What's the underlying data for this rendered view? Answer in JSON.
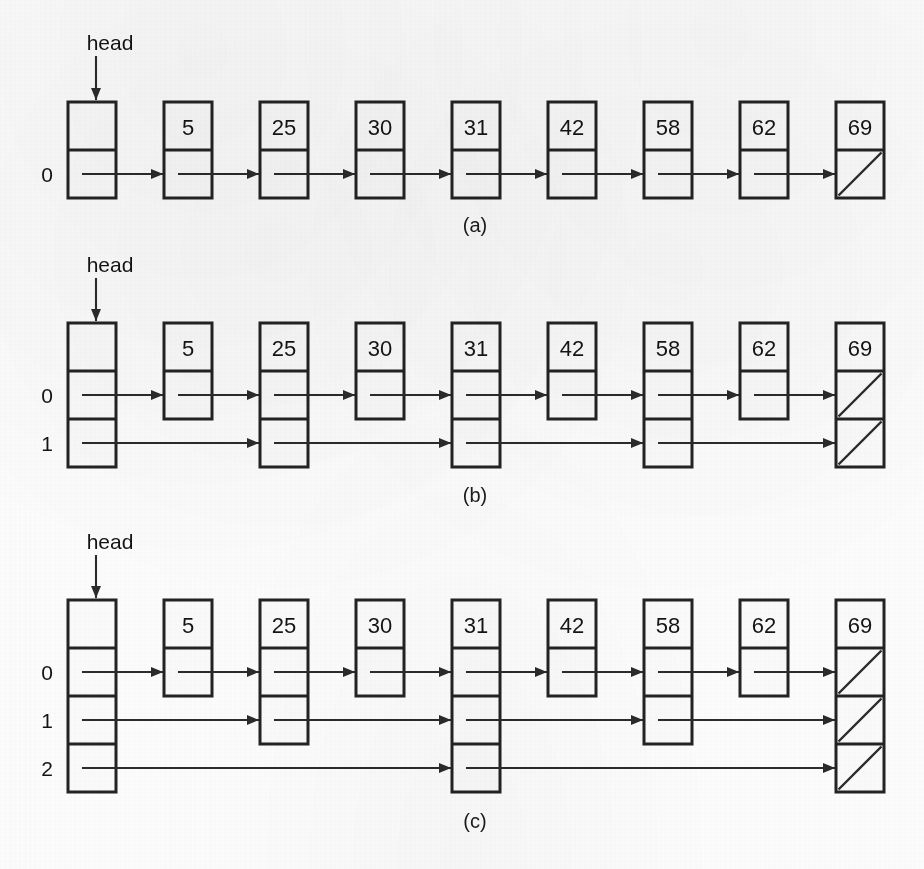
{
  "figure": {
    "head_label": "head",
    "nil_marker": "diagonal-slash",
    "ink_color": "#232323",
    "paper_color": "#fdfdfd"
  },
  "geometry": {
    "node_width": 48,
    "cell_height": 48,
    "node_pitch": 96,
    "first_node_x": 68,
    "key_column_x": [
      68,
      164,
      260,
      356,
      452,
      548,
      644,
      740,
      836
    ],
    "level_label_x": 47
  },
  "panels": [
    {
      "id": "a",
      "caption": "(a)",
      "caption_x": 475,
      "caption_y": 232,
      "head_label": "head",
      "head_label_x": 110,
      "head_label_y": 50,
      "head_arrow_x": 96,
      "head_arrow_y1": 56,
      "head_arrow_y2": 100,
      "top_y": 102,
      "max_levels": 1,
      "level_labels": [
        "0"
      ],
      "nodes": [
        {
          "key": "",
          "is_head": true,
          "levels": 1,
          "x": 68
        },
        {
          "key": "5",
          "levels": 1,
          "x": 164
        },
        {
          "key": "25",
          "levels": 1,
          "x": 260
        },
        {
          "key": "30",
          "levels": 1,
          "x": 356
        },
        {
          "key": "31",
          "levels": 1,
          "x": 452
        },
        {
          "key": "42",
          "levels": 1,
          "x": 548
        },
        {
          "key": "58",
          "levels": 1,
          "x": 644
        },
        {
          "key": "62",
          "levels": 1,
          "x": 740
        },
        {
          "key": "69",
          "levels": 1,
          "x": 836,
          "nil_levels": [
            0
          ]
        }
      ],
      "links": [
        {
          "level": 0,
          "from_x": 68,
          "to_x": 164
        },
        {
          "level": 0,
          "from_x": 164,
          "to_x": 260
        },
        {
          "level": 0,
          "from_x": 260,
          "to_x": 356
        },
        {
          "level": 0,
          "from_x": 356,
          "to_x": 452
        },
        {
          "level": 0,
          "from_x": 452,
          "to_x": 548
        },
        {
          "level": 0,
          "from_x": 548,
          "to_x": 644
        },
        {
          "level": 0,
          "from_x": 644,
          "to_x": 740
        },
        {
          "level": 0,
          "from_x": 740,
          "to_x": 836
        }
      ]
    },
    {
      "id": "b",
      "caption": "(b)",
      "caption_x": 475,
      "caption_y": 502,
      "head_label": "head",
      "head_label_x": 110,
      "head_label_y": 272,
      "head_arrow_x": 96,
      "head_arrow_y1": 278,
      "head_arrow_y2": 321,
      "top_y": 323,
      "max_levels": 2,
      "level_labels": [
        "0",
        "1"
      ],
      "nodes": [
        {
          "key": "",
          "is_head": true,
          "levels": 2,
          "x": 68
        },
        {
          "key": "5",
          "levels": 1,
          "x": 164
        },
        {
          "key": "25",
          "levels": 2,
          "x": 260
        },
        {
          "key": "30",
          "levels": 1,
          "x": 356
        },
        {
          "key": "31",
          "levels": 2,
          "x": 452
        },
        {
          "key": "42",
          "levels": 1,
          "x": 548
        },
        {
          "key": "58",
          "levels": 2,
          "x": 644
        },
        {
          "key": "62",
          "levels": 1,
          "x": 740
        },
        {
          "key": "69",
          "levels": 2,
          "x": 836,
          "nil_levels": [
            0,
            1
          ]
        }
      ],
      "links": [
        {
          "level": 0,
          "from_x": 68,
          "to_x": 164
        },
        {
          "level": 0,
          "from_x": 164,
          "to_x": 260
        },
        {
          "level": 0,
          "from_x": 260,
          "to_x": 356
        },
        {
          "level": 0,
          "from_x": 356,
          "to_x": 452
        },
        {
          "level": 0,
          "from_x": 452,
          "to_x": 548
        },
        {
          "level": 0,
          "from_x": 548,
          "to_x": 644
        },
        {
          "level": 0,
          "from_x": 644,
          "to_x": 740
        },
        {
          "level": 0,
          "from_x": 740,
          "to_x": 836
        },
        {
          "level": 1,
          "from_x": 68,
          "to_x": 260
        },
        {
          "level": 1,
          "from_x": 260,
          "to_x": 452
        },
        {
          "level": 1,
          "from_x": 452,
          "to_x": 644
        },
        {
          "level": 1,
          "from_x": 644,
          "to_x": 836
        }
      ]
    },
    {
      "id": "c",
      "caption": "(c)",
      "caption_x": 475,
      "caption_y": 828,
      "head_label": "head",
      "head_label_x": 110,
      "head_label_y": 549,
      "head_arrow_x": 96,
      "head_arrow_y1": 555,
      "head_arrow_y2": 598,
      "top_y": 600,
      "max_levels": 3,
      "level_labels": [
        "0",
        "1",
        "2"
      ],
      "nodes": [
        {
          "key": "",
          "is_head": true,
          "levels": 3,
          "x": 68
        },
        {
          "key": "5",
          "levels": 1,
          "x": 164
        },
        {
          "key": "25",
          "levels": 2,
          "x": 260
        },
        {
          "key": "30",
          "levels": 1,
          "x": 356
        },
        {
          "key": "31",
          "levels": 3,
          "x": 452
        },
        {
          "key": "42",
          "levels": 1,
          "x": 548
        },
        {
          "key": "58",
          "levels": 2,
          "x": 644
        },
        {
          "key": "62",
          "levels": 1,
          "x": 740
        },
        {
          "key": "69",
          "levels": 3,
          "x": 836,
          "nil_levels": [
            0,
            1,
            2
          ]
        }
      ],
      "links": [
        {
          "level": 0,
          "from_x": 68,
          "to_x": 164
        },
        {
          "level": 0,
          "from_x": 164,
          "to_x": 260
        },
        {
          "level": 0,
          "from_x": 260,
          "to_x": 356
        },
        {
          "level": 0,
          "from_x": 356,
          "to_x": 452
        },
        {
          "level": 0,
          "from_x": 452,
          "to_x": 548
        },
        {
          "level": 0,
          "from_x": 548,
          "to_x": 644
        },
        {
          "level": 0,
          "from_x": 644,
          "to_x": 740
        },
        {
          "level": 0,
          "from_x": 740,
          "to_x": 836
        },
        {
          "level": 1,
          "from_x": 68,
          "to_x": 260
        },
        {
          "level": 1,
          "from_x": 260,
          "to_x": 452
        },
        {
          "level": 1,
          "from_x": 452,
          "to_x": 644
        },
        {
          "level": 1,
          "from_x": 644,
          "to_x": 836
        },
        {
          "level": 2,
          "from_x": 68,
          "to_x": 452
        },
        {
          "level": 2,
          "from_x": 452,
          "to_x": 836
        }
      ]
    }
  ],
  "chart_data": {
    "type": "diagram",
    "subtype": "skip-list",
    "keys": [
      5,
      25,
      30,
      31,
      42,
      58,
      62,
      69
    ],
    "panels": [
      {
        "label": "(a)",
        "levels": 1,
        "node_heights": {
          "head": 1,
          "5": 1,
          "25": 1,
          "30": 1,
          "31": 1,
          "42": 1,
          "58": 1,
          "62": 1,
          "69": 1
        },
        "level_chains": {
          "0": [
            "head",
            "5",
            "25",
            "30",
            "31",
            "42",
            "58",
            "62",
            "69"
          ]
        }
      },
      {
        "label": "(b)",
        "levels": 2,
        "node_heights": {
          "head": 2,
          "5": 1,
          "25": 2,
          "30": 1,
          "31": 2,
          "42": 1,
          "58": 2,
          "62": 1,
          "69": 2
        },
        "level_chains": {
          "0": [
            "head",
            "5",
            "25",
            "30",
            "31",
            "42",
            "58",
            "62",
            "69"
          ],
          "1": [
            "head",
            "25",
            "31",
            "58",
            "69"
          ]
        }
      },
      {
        "label": "(c)",
        "levels": 3,
        "node_heights": {
          "head": 3,
          "5": 1,
          "25": 2,
          "30": 1,
          "31": 3,
          "42": 1,
          "58": 2,
          "62": 1,
          "69": 3
        },
        "level_chains": {
          "0": [
            "head",
            "5",
            "25",
            "30",
            "31",
            "42",
            "58",
            "62",
            "69"
          ],
          "1": [
            "head",
            "25",
            "31",
            "58",
            "69"
          ],
          "2": [
            "head",
            "31",
            "69"
          ]
        }
      }
    ]
  }
}
